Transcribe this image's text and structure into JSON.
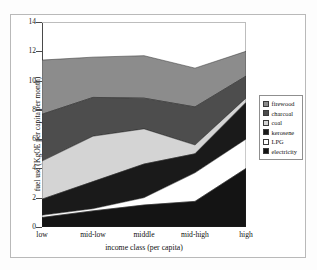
{
  "chart_data": {
    "type": "area",
    "stacked": true,
    "title": "",
    "xlabel": "income class (per capita)",
    "ylabel": "fuel use (KgOE per capita per month)",
    "categories": [
      "low",
      "mid-low",
      "middle",
      "mid-high",
      "high"
    ],
    "ylim": [
      0,
      14
    ],
    "yticks": [
      0,
      2,
      4,
      6,
      8,
      10,
      12,
      14
    ],
    "ytick_labels": [
      "0",
      "2",
      "4",
      "6",
      "8",
      "10",
      "12",
      "14"
    ],
    "grid": false,
    "legend_position": "right-outside",
    "stack_order_bottom_to_top": [
      "electricity",
      "LPG",
      "kerosene",
      "coal",
      "charcoal",
      "firewood"
    ],
    "series": [
      {
        "name": "firewood",
        "color": "#8c8c8c",
        "values": [
          3.7,
          2.75,
          2.9,
          2.65,
          1.7
        ],
        "cumulative_top": [
          11.4,
          11.6,
          11.7,
          10.85,
          12.0
        ]
      },
      {
        "name": "charcoal",
        "color": "#4d4d4d",
        "values": [
          3.2,
          2.65,
          2.1,
          2.6,
          1.5
        ],
        "cumulative_top": [
          7.7,
          8.85,
          8.8,
          8.2,
          10.3
        ]
      },
      {
        "name": "coal",
        "color": "#d4d4d4",
        "values": [
          2.6,
          3.1,
          2.4,
          0.6,
          0.3
        ],
        "cumulative_top": [
          4.5,
          6.2,
          6.7,
          5.6,
          8.8
        ]
      },
      {
        "name": "kerosene",
        "color": "#1a1a1a",
        "values": [
          1.1,
          1.85,
          2.3,
          1.3,
          2.5
        ],
        "cumulative_top": [
          1.9,
          3.1,
          4.3,
          5.0,
          8.5
        ]
      },
      {
        "name": "LPG",
        "color": "#ffffff",
        "values": [
          0.15,
          0.15,
          0.5,
          1.95,
          2.0
        ],
        "cumulative_top": [
          0.8,
          1.25,
          2.0,
          3.7,
          6.0
        ]
      },
      {
        "name": "electricity",
        "color": "#141414",
        "values": [
          0.65,
          1.1,
          1.5,
          1.75,
          4.0
        ],
        "cumulative_top": [
          0.65,
          1.1,
          1.5,
          1.75,
          4.0
        ]
      }
    ],
    "totals": [
      11.4,
      11.6,
      11.7,
      10.85,
      12.0
    ]
  },
  "legend": {
    "items": [
      {
        "label": "firewood",
        "color": "#8c8c8c"
      },
      {
        "label": "charcoal",
        "color": "#4d4d4d"
      },
      {
        "label": "coal",
        "color": "#d4d4d4"
      },
      {
        "label": "kerosene",
        "color": "#1a1a1a"
      },
      {
        "label": "LPG",
        "color": "#ffffff"
      },
      {
        "label": "electricity",
        "color": "#141414"
      }
    ]
  },
  "axes": {
    "y_title": "fuel use (KgOE per capita per month)",
    "x_title": "income class (per capita)"
  }
}
